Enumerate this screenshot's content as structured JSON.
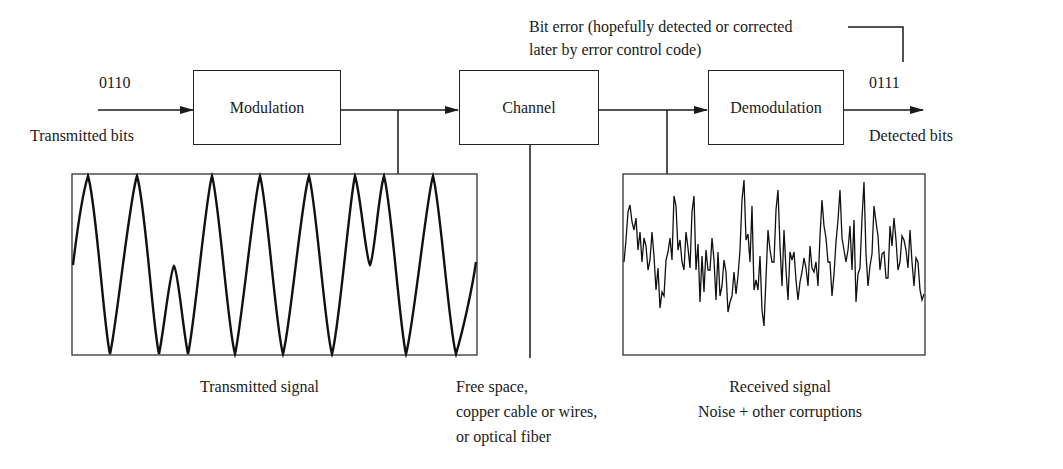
{
  "diagram": {
    "input": {
      "bits": "0110",
      "label": "Transmitted bits"
    },
    "blocks": [
      {
        "id": "modulation",
        "label": "Modulation"
      },
      {
        "id": "channel",
        "label": "Channel"
      },
      {
        "id": "demodulation",
        "label": "Demodulation"
      }
    ],
    "output": {
      "bits": "0111",
      "label": "Detected bits"
    },
    "annotations": {
      "bit_error_line1": "Bit error (hopefully detected or corrected",
      "bit_error_line2": "later by error control code)",
      "transmitted_signal": "Transmitted signal",
      "channel_media_line1": "Free space,",
      "channel_media_line2": "copper cable or wires,",
      "channel_media_line3": "or optical fiber",
      "received_signal_line1": "Received signal",
      "received_signal_line2": "Noise + other corruptions"
    },
    "colors": {
      "ink": "#1a1a1a",
      "background": "#ffffff"
    }
  }
}
